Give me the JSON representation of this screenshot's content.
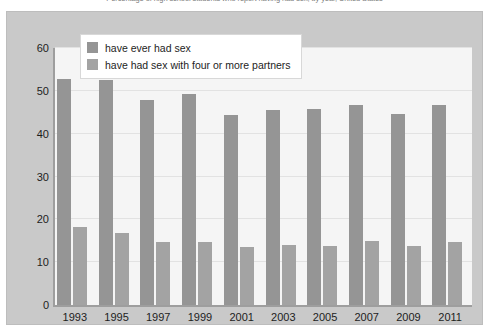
{
  "caption": {
    "text": "Percentage of high school students who report having had sex, by year, United States"
  },
  "legend": {
    "position": "top-left-inside",
    "items": [
      {
        "label": "have ever had sex",
        "color": "#959595"
      },
      {
        "label": "have had sex with four or more partners",
        "color": "#a3a3a3"
      }
    ]
  },
  "chart_data": {
    "type": "bar",
    "title": "",
    "xlabel": "",
    "ylabel": "",
    "ylim": [
      0,
      60
    ],
    "yticks": [
      0,
      10,
      20,
      30,
      40,
      50,
      60
    ],
    "grid": true,
    "categories": [
      "1993",
      "1995",
      "1997",
      "1999",
      "2001",
      "2003",
      "2005",
      "2007",
      "2009",
      "2011"
    ],
    "series": [
      {
        "name": "have ever had sex",
        "color": "#959595",
        "values": [
          52.7,
          52.5,
          47.8,
          49.2,
          44.3,
          45.5,
          45.8,
          46.6,
          44.6,
          46.8
        ]
      },
      {
        "name": "have had sex with four or more partners",
        "color": "#a3a3a3",
        "values": [
          18.1,
          16.7,
          14.6,
          14.7,
          13.5,
          14.1,
          13.8,
          15.0,
          13.7,
          14.7
        ]
      }
    ]
  },
  "colors": {
    "figure_background": "#c9c9c9",
    "plot_background": "#f5f5f5",
    "axis": "#9e9e9e",
    "gridline": "#e2e2e2",
    "text": "#1d1d1d"
  }
}
